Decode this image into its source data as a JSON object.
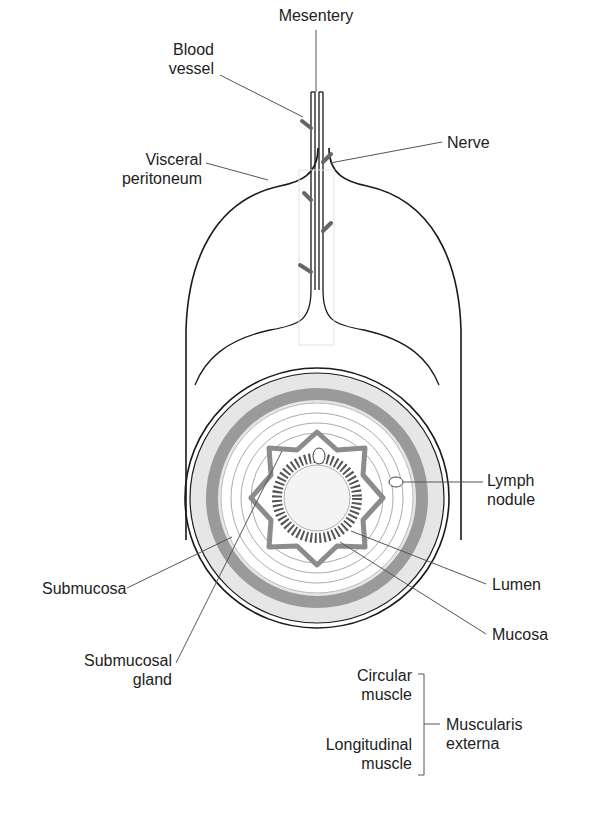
{
  "diagram": {
    "labels": {
      "mesentery": [
        "Mesentery"
      ],
      "blood_vessel": [
        "Blood",
        "vessel"
      ],
      "nerve": [
        "Nerve"
      ],
      "visceral_peritoneum": [
        "Visceral",
        "peritoneum"
      ],
      "lymph_nodule": [
        "Lymph",
        "nodule"
      ],
      "submucosa": [
        "Submucosa"
      ],
      "lumen": [
        "Lumen"
      ],
      "submucosal_gland": [
        "Submucosal",
        "gland"
      ],
      "mucosa": [
        "Mucosa"
      ],
      "circular_muscle": [
        "Circular",
        "muscle"
      ],
      "longitudinal_muscle": [
        "Longitudinal",
        "muscle"
      ],
      "muscularis_externa": [
        "Muscularis",
        "externa"
      ]
    },
    "colors": {
      "outline": "#1a1a1a",
      "muscle_gray": "#9a9a9a",
      "light_gray": "#d8d8d8",
      "mucosa_gray": "#7a7a7a",
      "leader": "#555555"
    }
  }
}
